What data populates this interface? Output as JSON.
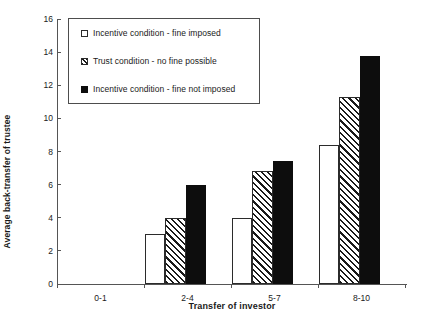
{
  "chart_data": {
    "type": "bar",
    "title": "",
    "xlabel": "Transfer of investor",
    "ylabel": "Average back-transfer of trustee",
    "categories": [
      "0-1",
      "2-4",
      "5-7",
      "8-10"
    ],
    "ylim": [
      0,
      16
    ],
    "yticks": [
      0,
      2,
      4,
      6,
      8,
      10,
      12,
      14,
      16
    ],
    "grid": false,
    "legend_position": "upper-left-inside",
    "series": [
      {
        "name": "Incentive condition - fine imposed",
        "style": "open-white",
        "color": "#ffffff",
        "values": [
          0,
          3.0,
          4.0,
          8.4
        ]
      },
      {
        "name": "Trust condition - no fine possible",
        "style": "diagonal-hatch",
        "color": "#1a1a1a",
        "values": [
          0,
          4.0,
          6.85,
          11.3
        ]
      },
      {
        "name": "Incentive condition - fine not imposed",
        "style": "solid-black",
        "color": "#0d0d0d",
        "values": [
          0,
          6.0,
          7.4,
          13.75
        ]
      }
    ]
  }
}
